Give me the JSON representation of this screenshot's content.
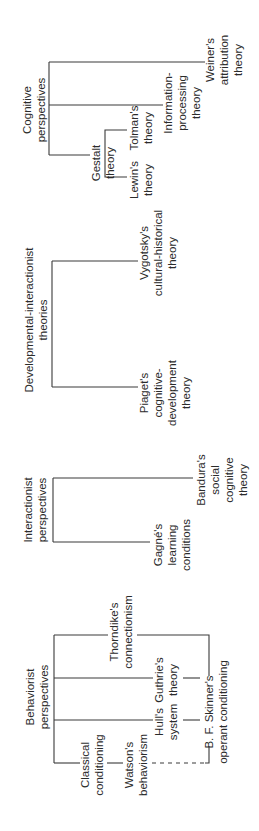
{
  "diagram": {
    "orientation": "rotated-90-ccw",
    "line_color": "#3a3a3a",
    "text_color": "#2b2b2b",
    "groups": {
      "cognitive": {
        "title": [
          "Cognitive",
          "perspectives"
        ],
        "gestalt": [
          "Gestalt",
          "theory"
        ],
        "lewin": [
          "Lewin's",
          "theory"
        ],
        "tolman": [
          "Tolman's",
          "theory"
        ],
        "information_processing": [
          "Information-",
          "processing",
          "theory"
        ],
        "weiner": [
          "Weiner's",
          "attribution",
          "theory"
        ]
      },
      "developmental": {
        "title": [
          "Developmental-interactionist",
          "theories"
        ],
        "vygotsky": [
          "Vygotsky's",
          "cultural-historical",
          "theory"
        ],
        "piaget": [
          "Piaget's",
          "cognitive-",
          "development",
          "theory"
        ]
      },
      "interactionist": {
        "title": [
          "Interactionist",
          "perspectives"
        ],
        "gagne": [
          "Gagné's",
          "learning",
          "conditions"
        ],
        "bandura": [
          "Bandura's",
          "social",
          "cognitive",
          "theory"
        ]
      },
      "behaviorist": {
        "title": [
          "Behaviorist",
          "perspectives"
        ],
        "thorndike": [
          "Thorndike's",
          "connectionism"
        ],
        "guthrie": [
          "Guthrie's",
          "theory"
        ],
        "hull": [
          "Hull's",
          "system"
        ],
        "classical": [
          "Classical",
          "conditioning"
        ],
        "watson": [
          "Watson's",
          "behaviorism"
        ],
        "skinner": [
          "B. F. Skinner's",
          "operant conditioning"
        ]
      }
    }
  }
}
